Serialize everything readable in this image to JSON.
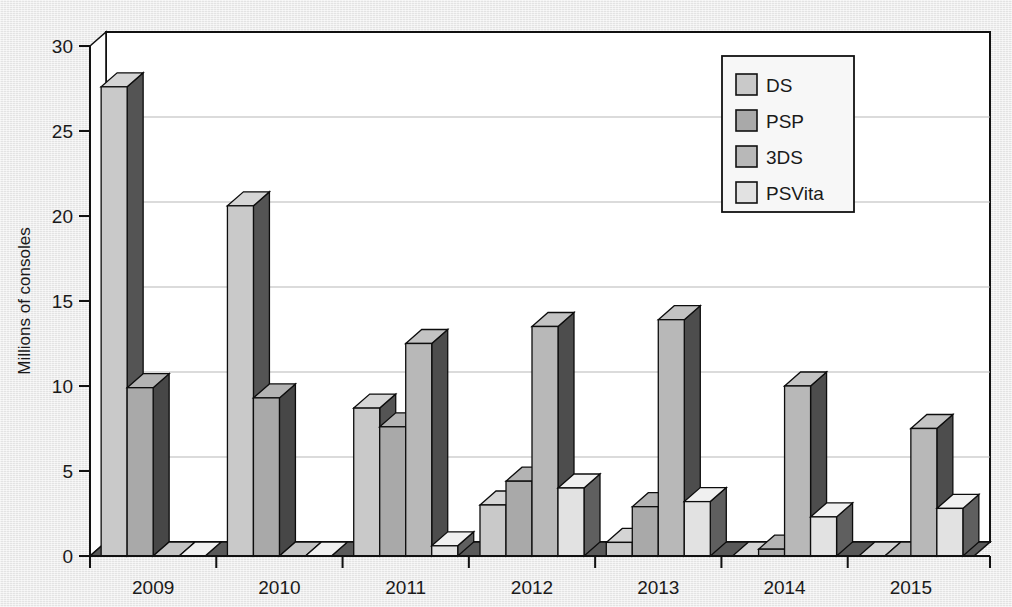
{
  "chart_data": {
    "type": "bar",
    "title": "",
    "subtitle": "",
    "xlabel": "",
    "ylabel": "Millions of consoles",
    "categories": [
      "2009",
      "2010",
      "2011",
      "2012",
      "2013",
      "2014",
      "2015"
    ],
    "series": [
      {
        "name": "DS",
        "color": "#c9c9c9",
        "values": [
          27.6,
          20.6,
          8.7,
          3.0,
          0.8,
          0.0,
          0.0
        ]
      },
      {
        "name": "PSP",
        "color": "#a9a9a9",
        "values": [
          9.9,
          9.3,
          7.6,
          4.4,
          2.9,
          0.4,
          0.0
        ]
      },
      {
        "name": "3DS",
        "color": "#b8b8b8",
        "values": [
          0.0,
          0.0,
          12.5,
          13.5,
          13.9,
          10.0,
          7.5
        ]
      },
      {
        "name": "PSVita",
        "color": "#e2e2e2",
        "values": [
          0.0,
          0.0,
          0.6,
          4.0,
          3.2,
          2.3,
          2.8
        ]
      }
    ],
    "ylim": [
      0,
      30
    ],
    "ytick_step": 5,
    "yticks": [
      "0",
      "5",
      "10",
      "15",
      "20",
      "25",
      "30"
    ],
    "grid": "horizontal",
    "legend_position": "top-right",
    "style": "3d-bars",
    "plot_background": "#ffffff",
    "figure_background": "#e9e9e9",
    "axis_color": "#111111",
    "gridline_color": "#b7b7b7"
  },
  "legend": {
    "entries": [
      {
        "label": "DS"
      },
      {
        "label": "PSP"
      },
      {
        "label": "3DS"
      },
      {
        "label": "PSVita"
      }
    ]
  }
}
